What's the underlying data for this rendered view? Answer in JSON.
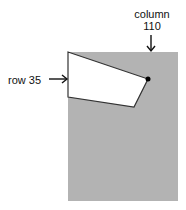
{
  "diagram": {
    "column_label": {
      "line1": "column",
      "line2": "110"
    },
    "row_label": "row 35",
    "colors": {
      "background": "#ffffff",
      "gray_region": "#b3b3b3",
      "polygon_fill": "#ffffff",
      "polygon_stroke": "#333333",
      "arrow": "#111111",
      "dot": "#000000"
    },
    "gray_region": {
      "x": 68,
      "y": 52,
      "width": 110,
      "height": 149
    },
    "polygon_points": "68,52 148,79 134,107 68,97",
    "marked_pixel": {
      "x": 148,
      "y": 79,
      "row": 35,
      "column": 110
    }
  }
}
